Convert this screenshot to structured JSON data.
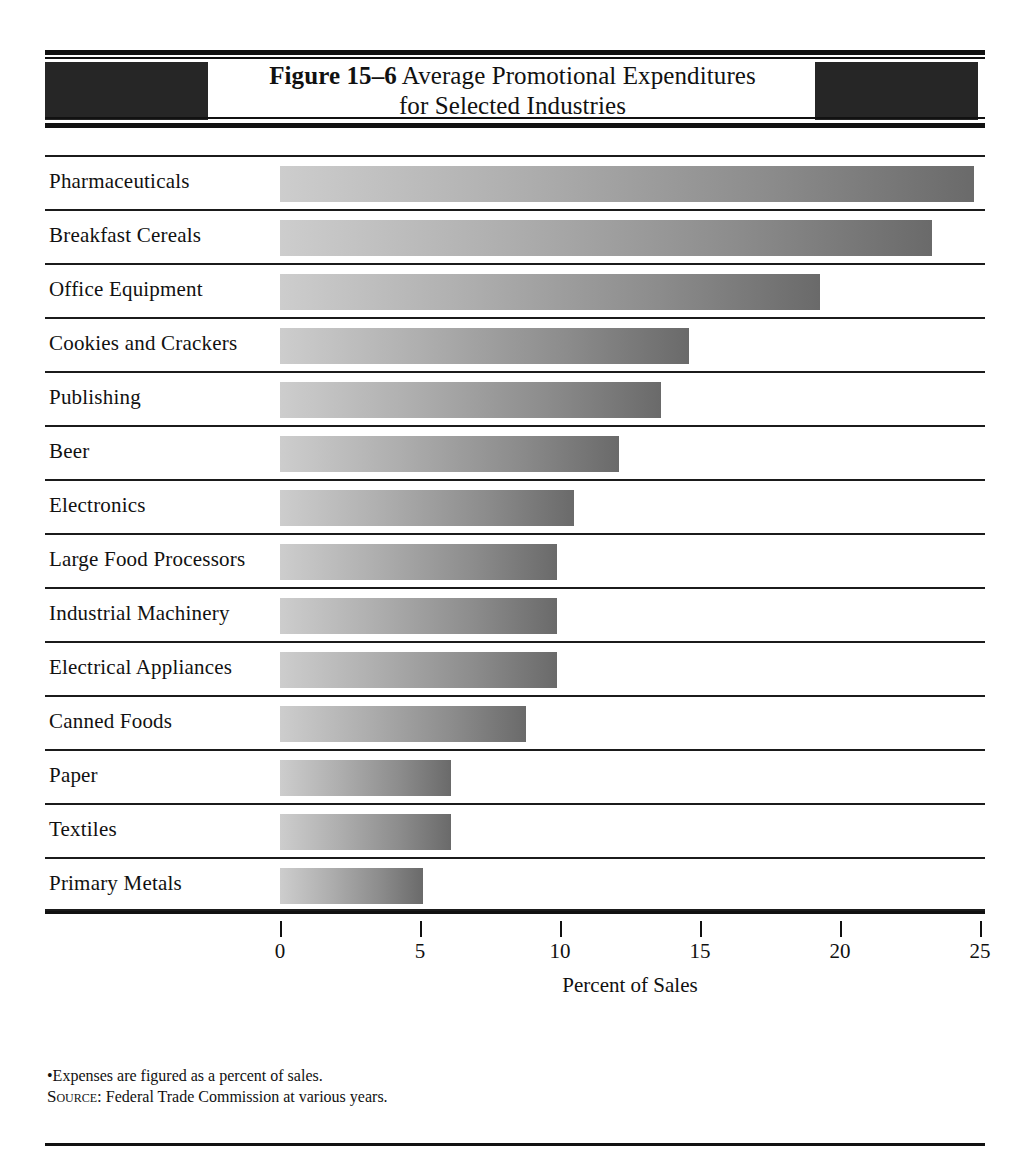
{
  "figure": {
    "number_label": "Figure 15–6",
    "title_line1": "Average Promotional Expenditures",
    "title_line2": "for Selected Industries"
  },
  "notes": {
    "footnote": "•Expenses are figured as a percent of sales.",
    "source_prefix": "Source:",
    "source_text": "Federal Trade Commission at various years."
  },
  "colors": {
    "bar_gradient_start": "#cdcdcd",
    "bar_gradient_end": "#6a6a6a",
    "header_block": "#262626",
    "rule": "#111111"
  },
  "chart_data": {
    "type": "bar",
    "orientation": "horizontal",
    "title": "Figure 15–6 Average Promotional Expenditures for Selected Industries",
    "xlabel": "Percent of Sales",
    "ylabel": "",
    "xlim": [
      0,
      25
    ],
    "xticks": [
      0,
      5,
      10,
      15,
      20,
      25
    ],
    "xtick_labels": [
      "0",
      "5",
      "10",
      "15",
      "20",
      "25"
    ],
    "grid": false,
    "legend": false,
    "categories": [
      "Pharmaceuticals",
      "Breakfast Cereals",
      "Office Equipment",
      "Cookies and Crackers",
      "Publishing",
      "Beer",
      "Electronics",
      "Large Food Processors",
      "Industrial Machinery",
      "Electrical Appliances",
      "Canned Foods",
      "Paper",
      "Textiles",
      "Primary Metals"
    ],
    "values": [
      24.8,
      23.3,
      19.3,
      14.6,
      13.6,
      12.1,
      10.5,
      9.9,
      9.9,
      9.9,
      8.8,
      6.1,
      6.1,
      5.1
    ],
    "units": "percent of sales"
  }
}
